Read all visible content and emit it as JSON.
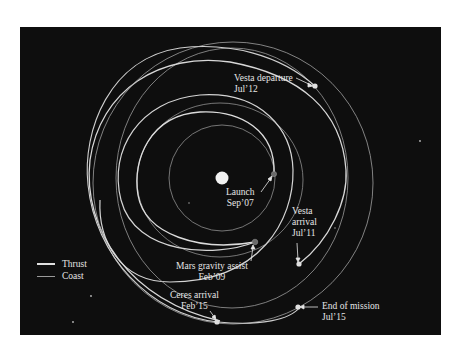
{
  "diagram": {
    "background_color": "#0e0e0e",
    "sun": {
      "label": "Sun",
      "color": "#f2f2f2"
    },
    "legend": [
      {
        "label": "Thrust",
        "style": "thrust",
        "color": "#e0e0e0"
      },
      {
        "label": "Coast",
        "style": "coast",
        "color": "#9a9a9a"
      }
    ],
    "events": [
      {
        "id": "launch",
        "line1": "Launch",
        "line2": "Sep’07"
      },
      {
        "id": "mars_gravity_assist",
        "line1": "Mars gravity assist",
        "line2": "Feb’09"
      },
      {
        "id": "vesta_arrival",
        "line1": "Vesta",
        "line2": "arrival",
        "line3": "Jul’11"
      },
      {
        "id": "vesta_departure",
        "line1": "Vesta departure",
        "line2": "Jul’12"
      },
      {
        "id": "ceres_arrival",
        "line1": "Ceres arrival",
        "line2": "Feb’15"
      },
      {
        "id": "end_of_mission",
        "line1": "End of mission",
        "line2": "Jul’15"
      }
    ]
  }
}
